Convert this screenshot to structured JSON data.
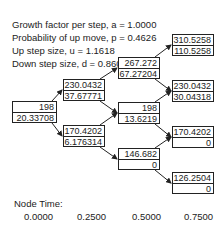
{
  "parameters": {
    "growth": "Growth factor per step, a = 1.0000",
    "prob": "Probability of up move, p = 0.4626",
    "up": "Up step size, u = 1.1618",
    "down": "Down step size, d = 0.8607"
  },
  "nodes": {
    "n0_0": {
      "price": "198",
      "value": "20.33708"
    },
    "n1_1": {
      "price": "230.0432",
      "value": "37.67771"
    },
    "n1_0": {
      "price": "170.4202",
      "value": "6.176314"
    },
    "n2_2": {
      "price": "267.272",
      "value": "67.27204"
    },
    "n2_1": {
      "price": "198",
      "value": "13.6219"
    },
    "n2_0": {
      "price": "146.682",
      "value": "0"
    },
    "n3_3": {
      "price": "310.5258",
      "value": "110.5258"
    },
    "n3_2": {
      "price": "230.0432",
      "value": "30.04318"
    },
    "n3_1": {
      "price": "170.4202",
      "value": "0"
    },
    "n3_0": {
      "price": "126.2504",
      "value": "0"
    }
  },
  "footer": {
    "node_time_label": "Node Time:",
    "times": [
      "0.0000",
      "0.2500",
      "0.5000",
      "0.7500"
    ]
  }
}
